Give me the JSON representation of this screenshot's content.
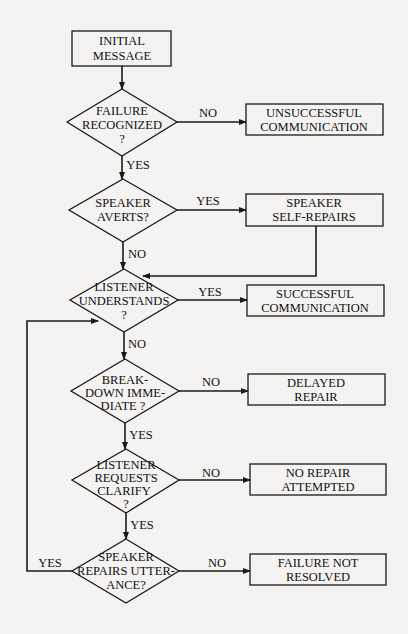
{
  "diagram": {
    "type": "flowchart",
    "nodes": {
      "initial": {
        "lines": [
          "INITIAL",
          "MESSAGE"
        ]
      },
      "d_failure": {
        "lines": [
          "FAILURE",
          "RECOGNIZED",
          "?"
        ]
      },
      "unsuccessful": {
        "lines": [
          "UNSUCCESSFUL",
          "COMMUNICATION"
        ]
      },
      "d_averts": {
        "lines": [
          "SPEAKER",
          "AVERTS?"
        ]
      },
      "self_repairs": {
        "lines": [
          "SPEAKER",
          "SELF-REPAIRS"
        ]
      },
      "d_understands": {
        "lines": [
          "LISTENER",
          "UNDERSTANDS",
          "?"
        ]
      },
      "successful": {
        "lines": [
          "SUCCESSFUL",
          "COMMUNICATION"
        ]
      },
      "d_breakdown": {
        "lines": [
          "BREAK-",
          "DOWN IMME-",
          "DIATE ?"
        ]
      },
      "delayed": {
        "lines": [
          "DELAYED",
          "REPAIR"
        ]
      },
      "d_requests": {
        "lines": [
          "LISTENER",
          "REQUESTS",
          "CLARIFY",
          "?"
        ]
      },
      "no_repair": {
        "lines": [
          "NO REPAIR",
          "ATTEMPTED"
        ]
      },
      "d_repairs": {
        "lines": [
          "SPEAKER",
          "REPAIRS UTTER-",
          "ANCE?"
        ]
      },
      "not_resolved": {
        "lines": [
          "FAILURE NOT",
          "RESOLVED"
        ]
      }
    },
    "edge_labels": {
      "failure_no": "NO",
      "failure_yes": "YES",
      "averts_yes": "YES",
      "averts_no": "NO",
      "understands_yes": "YES",
      "understands_no": "NO",
      "breakdown_no": "NO",
      "breakdown_yes": "YES",
      "requests_no": "NO",
      "requests_yes": "YES",
      "repairs_no": "NO",
      "repairs_yes": "YES"
    }
  }
}
